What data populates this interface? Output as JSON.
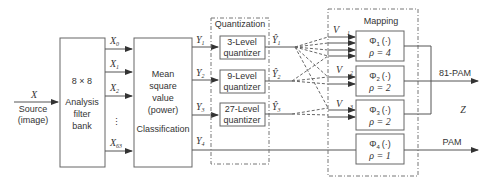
{
  "diagram": {
    "input": {
      "symbol": "X",
      "label_line1": "Source",
      "label_line2": "(image)"
    },
    "filter_bank": {
      "line1": "8 × 8",
      "line2": "Analysis",
      "line3": "filter",
      "line4": "bank"
    },
    "coefficients": [
      {
        "name": "X",
        "sub": "0"
      },
      {
        "name": "X",
        "sub": "1"
      },
      {
        "name": "X",
        "sub": "2"
      },
      {
        "name": "X",
        "sub": "63"
      }
    ],
    "ellipsis": "⋮",
    "classifier": {
      "line1": "Mean",
      "line2": "square",
      "line3": "value",
      "line4": "(power)",
      "line5": "Classification"
    },
    "classes": [
      {
        "name": "Y",
        "sub": "1"
      },
      {
        "name": "Y",
        "sub": "2"
      },
      {
        "name": "Y",
        "sub": "3"
      },
      {
        "name": "Y",
        "sub": "4"
      }
    ],
    "quantization": {
      "title": "Quantization",
      "quantizers": [
        {
          "line1": "3-Level",
          "line2": "quantizer"
        },
        {
          "line1": "9-Level",
          "line2": "quantizer"
        },
        {
          "line1": "27-Level",
          "line2": "quantizer"
        }
      ],
      "outputs": [
        {
          "name": "Ŷ",
          "sub": "1"
        },
        {
          "name": "Ŷ",
          "sub": "2"
        },
        {
          "name": "Ŷ",
          "sub": "3"
        }
      ]
    },
    "mapping": {
      "title": "Mapping",
      "vectors": [
        {
          "name": "V⃗",
          "sub": "1"
        },
        {
          "name": "V⃗",
          "sub": "2"
        },
        {
          "name": "V⃗",
          "sub": "3"
        }
      ],
      "blocks": [
        {
          "phi": "Φ",
          "sub": "1",
          "arg": "(·)",
          "rho": "ρ = 4"
        },
        {
          "phi": "Φ",
          "sub": "2",
          "arg": "(·)",
          "rho": "ρ = 2"
        },
        {
          "phi": "Φ",
          "sub": "3",
          "arg": "(·)",
          "rho": "ρ = 2"
        },
        {
          "phi": "Φ",
          "sub": "4",
          "arg": "(·)",
          "rho": "ρ = 1"
        }
      ]
    },
    "outputs": {
      "pam81": "81-PAM",
      "z": "Z",
      "pam": "PAM"
    }
  }
}
